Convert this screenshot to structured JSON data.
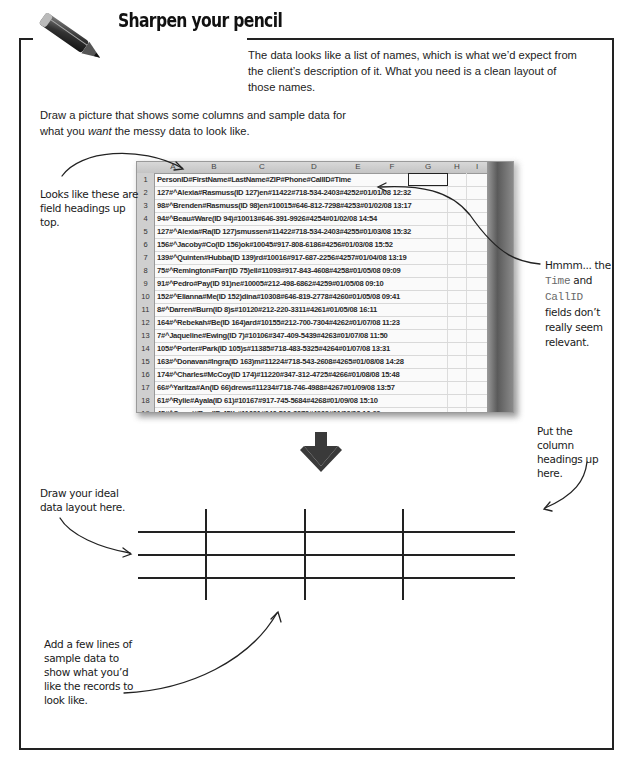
{
  "header": {
    "title": "Sharpen your pencil",
    "icon": "pencil-icon"
  },
  "intro_text": "The data looks like a list of names, which is what we’d expect from the client’s description of it. What you need is a clean layout of those names.",
  "instruction": {
    "before": "Draw a picture that shows some columns and sample data for what you ",
    "emphasis": "want",
    "after": " the messy data to look like."
  },
  "annotations": {
    "field_headings": "Looks like these are field headings up top.",
    "irrelevant_fields": {
      "prefix": "Hmmm... the",
      "field1": "Time",
      "middle": "and",
      "field2": "CallID",
      "suffix": "fields don’t really seem relevant."
    },
    "column_headings": "Put the column headings up here.",
    "ideal_layout": "Draw your ideal data layout here.",
    "sample_data": "Add a few lines of sample data to show what you’d like the records to look like."
  },
  "spreadsheet": {
    "columns": [
      "A",
      "B",
      "C",
      "D",
      "E",
      "F",
      "G",
      "H",
      "I"
    ],
    "rows": [
      {
        "num": "1",
        "value": "PersonID#FirstName#LastName#ZIP#Phone#CallID#Time"
      },
      {
        "num": "2",
        "value": "127#^Alexia#Rasmuss(ID 127)en#11422#718-534-2403#4252#01/01/08 12:32"
      },
      {
        "num": "3",
        "value": "98#^Brenden#Rasmuss(ID 98)en#10015#646-812-7298#4253#01/02/08 13:17"
      },
      {
        "num": "4",
        "value": "94#^Beau#Ware(ID 94)#10013#646-391-9926#4254#01/02/08 14:54"
      },
      {
        "num": "5",
        "value": "127#^Alexia#Ra(ID 127)smussen#11422#718-534-2403#4255#01/03/08 15:32"
      },
      {
        "num": "6",
        "value": "156#^Jacoby#Co(ID 156)ok#10045#917-808-6186#4256#01/03/08 15:52"
      },
      {
        "num": "7",
        "value": "139#^Quinten#Hubba(ID 139)rd#10016#917-687-2256#4257#01/04/08 13:19"
      },
      {
        "num": "8",
        "value": "75#^Remington#Farr(ID 75)ell#11093#917-843-4608#4258#01/05/08 09:09"
      },
      {
        "num": "9",
        "value": "91#^Pedro#Pay(ID 91)ne#10005#212-498-6862#4259#01/05/08 09:10"
      },
      {
        "num": "10",
        "value": "152#^Elianna#Me(ID 152)dina#10308#646-819-2778#4260#01/05/08 09:41"
      },
      {
        "num": "11",
        "value": "8#^Darren#Burn(ID 8)s#10120#212-220-3311#4261#01/05/08 16:11"
      },
      {
        "num": "12",
        "value": "164#^Rebekah#Be(ID 164)ard#10155#212-700-7304#4262#01/07/08 11:23"
      },
      {
        "num": "13",
        "value": "7#^Jaqueline#Ewing(ID 7)#10106#347-409-5439#4263#01/07/08 11:50"
      },
      {
        "num": "14",
        "value": "105#^Porter#Park(ID 105)s#11385#718-483-5325#4264#01/07/08 13:31"
      },
      {
        "num": "15",
        "value": "163#^Donavan#Ingra(ID 163)m#11224#718-543-2608#4265#01/08/08 14:28"
      },
      {
        "num": "16",
        "value": "174#^Charles#McCoy(ID 174)#11220#347-312-4725#4266#01/08/08 15:48"
      },
      {
        "num": "17",
        "value": "66#^Yaritza#An(ID 66)drews#11234#718-746-4988#4267#01/09/08 13:57"
      },
      {
        "num": "18",
        "value": "61#^Rylie#Ayala(ID 61)#10167#917-745-5684#4268#01/09/08 15:10"
      },
      {
        "num": "19",
        "value": "45#^Omari#Rus(ID 45)h#11691#646-516-3070#4269#01/09/08 16:29"
      }
    ]
  },
  "colors": {
    "ink": "#1a1a1a",
    "frame": "#222222",
    "mono_field": "#6a6a6a",
    "arrow": "#3a3a3a"
  }
}
